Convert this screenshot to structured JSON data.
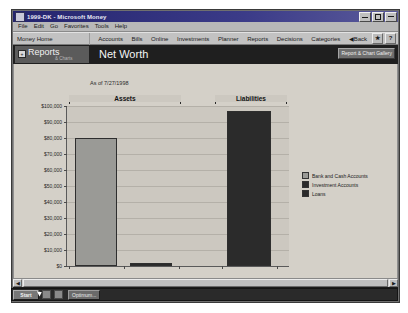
{
  "window": {
    "title": "1999-DK - Microsoft Money",
    "app_icon": "money-app-icon",
    "minimize_label": "_",
    "maximize_label": "",
    "close_label": "x"
  },
  "menubar": {
    "items": [
      {
        "label": "File"
      },
      {
        "label": "Edit"
      },
      {
        "label": "Go"
      },
      {
        "label": "Favorites"
      },
      {
        "label": "Tools"
      },
      {
        "label": "Help"
      }
    ]
  },
  "navbar": {
    "home_label": "Money Home",
    "links": [
      {
        "label": "Accounts"
      },
      {
        "label": "Bills"
      },
      {
        "label": "Online"
      },
      {
        "label": "Investments"
      },
      {
        "label": "Planner"
      },
      {
        "label": "Reports"
      },
      {
        "label": "Decisions"
      },
      {
        "label": "Categories"
      }
    ],
    "back_label": "Back",
    "back_arrow": "◀",
    "favorites_icon": "star-icon",
    "help_icon": "question-mark-icon",
    "help_label": "?"
  },
  "report_band": {
    "tab_label": "Reports",
    "tab_sub_label": "& Charts",
    "expand_icon": "+",
    "title": "Net Worth",
    "gallery_button_label": "Report & Chart Gallery"
  },
  "chart_header": {
    "as_of": "As of 7/27/1998"
  },
  "status": {
    "text": "Bar chart"
  },
  "scrollbar": {
    "left_arrow": "◀",
    "right_arrow": "▶"
  },
  "taskbar": {
    "start_label": "Start",
    "task_item_label": "Optimum...",
    "tray_icons": [
      "speaker-icon",
      "clock-icon"
    ]
  },
  "chart_data": {
    "type": "bar",
    "title": "Net Worth",
    "subtitle": "As of 7/27/1998",
    "xlabel": "",
    "ylabel": "",
    "ylim": [
      0,
      100000
    ],
    "grid": true,
    "legend_position": "right",
    "groups": [
      "Assets",
      "Liabilities"
    ],
    "categories": [
      "Bank and Cash Accounts",
      "Investment Accounts",
      "Loans"
    ],
    "series": [
      {
        "name": "Bank and Cash Accounts",
        "group": "Assets",
        "value": 80000,
        "color": "#9a9a96"
      },
      {
        "name": "Investment Accounts",
        "group": "Assets",
        "value": 2000,
        "color": "#2b2b2b"
      },
      {
        "name": "Loans",
        "group": "Liabilities",
        "value": 97000,
        "color": "#2b2b2b"
      }
    ],
    "ytick_labels": [
      "$100,000",
      "$90,000",
      "$80,000",
      "$70,000",
      "$60,000",
      "$50,000",
      "$40,000",
      "$30,000",
      "$20,000",
      "$10,000",
      "$0"
    ],
    "ytick_values": [
      100000,
      90000,
      80000,
      70000,
      60000,
      50000,
      40000,
      30000,
      20000,
      10000,
      0
    ],
    "legend": [
      {
        "label": "Bank and Cash Accounts",
        "color": "#9a9a96"
      },
      {
        "label": "Investment Accounts",
        "color": "#2b2b2b"
      },
      {
        "label": "Loans",
        "color": "#2b2b2b"
      }
    ]
  },
  "colors": {
    "titlebar": "#24246e",
    "band": "#1f1f1f",
    "client": "#d4d0c8",
    "plot": "#ccc8c0",
    "bar_light": "#9a9a96",
    "bar_dark": "#2b2b2b"
  }
}
